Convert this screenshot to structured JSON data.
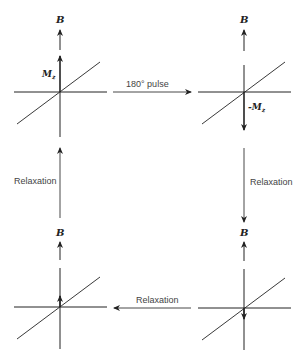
{
  "diagram": {
    "panels": [
      {
        "id": "top-left",
        "field_label": "B",
        "magnetization_label": "M",
        "magnetization_sub": "z",
        "magnetization_direction": "up",
        "magnetization_size": "full"
      },
      {
        "id": "top-right",
        "field_label": "B",
        "magnetization_label": "-M",
        "magnetization_sub": "z",
        "magnetization_direction": "down",
        "magnetization_size": "full"
      },
      {
        "id": "bottom-right",
        "field_label": "B",
        "magnetization_direction": "down",
        "magnetization_size": "small"
      },
      {
        "id": "bottom-left",
        "field_label": "B",
        "magnetization_direction": "up",
        "magnetization_size": "small"
      }
    ],
    "transitions": [
      {
        "from": "top-left",
        "to": "top-right",
        "label": "180° pulse"
      },
      {
        "from": "top-right",
        "to": "bottom-right",
        "label": "Relaxation"
      },
      {
        "from": "bottom-right",
        "to": "bottom-left",
        "label": "Relaxation"
      },
      {
        "from": "bottom-left",
        "to": "top-left",
        "label": "Relaxation"
      }
    ],
    "colors": {
      "line": "#222222",
      "text": "#444444",
      "background": "#ffffff"
    }
  }
}
